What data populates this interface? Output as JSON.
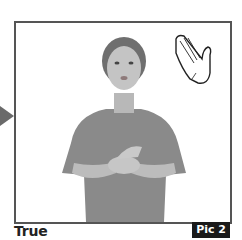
{
  "caption": "True",
  "badge": "Pic 2",
  "icons": {
    "arrow": "arrow-right-icon",
    "hand": "flat-hand-icon"
  },
  "colors": {
    "frame_border": "#555555",
    "badge_bg": "#1a1a1a",
    "badge_text": "#ffffff",
    "arrow": "#6a6a6a"
  }
}
